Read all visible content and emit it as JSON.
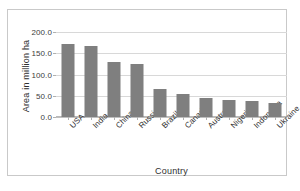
{
  "chart_data": {
    "type": "bar",
    "title": "",
    "xlabel": "Country",
    "ylabel": "Area in million ha",
    "categories": [
      "USA",
      "India",
      "China",
      "Russia",
      "Brazil",
      "Canada",
      "Australia",
      "Nigeria",
      "Indonesia",
      "Ukraine"
    ],
    "values": [
      172.0,
      168.0,
      130.0,
      124.0,
      65.0,
      53.0,
      45.0,
      41.0,
      37.0,
      33.0
    ],
    "ylim": [
      0,
      200
    ],
    "ytick_labels": [
      "200.0",
      "150.0",
      "100.0",
      "50.0",
      "0.0"
    ],
    "ytick_values": [
      200,
      150,
      100,
      50,
      0
    ],
    "grid": true,
    "legend": "none",
    "bar_color": "#7f7f7f",
    "gridline_color": "#d8d8d8",
    "plot_background": "#ffffff",
    "frame_color": "#c9c9c9"
  }
}
